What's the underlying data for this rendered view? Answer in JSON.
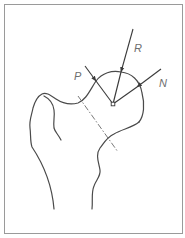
{
  "diagram": {
    "type": "force diagram of proximal femur (femoral head)",
    "colors": {
      "stroke": "#4a4a4a",
      "border": "#9a9a9a",
      "label": "#6e6e6e",
      "background": "#ffffff"
    },
    "labels": {
      "R": "R",
      "P": "P",
      "N": "N"
    },
    "forces": [
      {
        "id": "R",
        "label": "R",
        "from": [
          133,
          29
        ],
        "to": [
          121,
          72
        ]
      },
      {
        "id": "P",
        "label": "P",
        "from": [
          85,
          66
        ],
        "to": [
          96,
          81
        ]
      },
      {
        "id": "N",
        "label": "N",
        "from": [
          161,
          69
        ],
        "to": [
          137,
          87
        ]
      }
    ],
    "center_point": [
      113,
      104
    ],
    "neck_axis": "dash-dot line through femoral neck"
  }
}
